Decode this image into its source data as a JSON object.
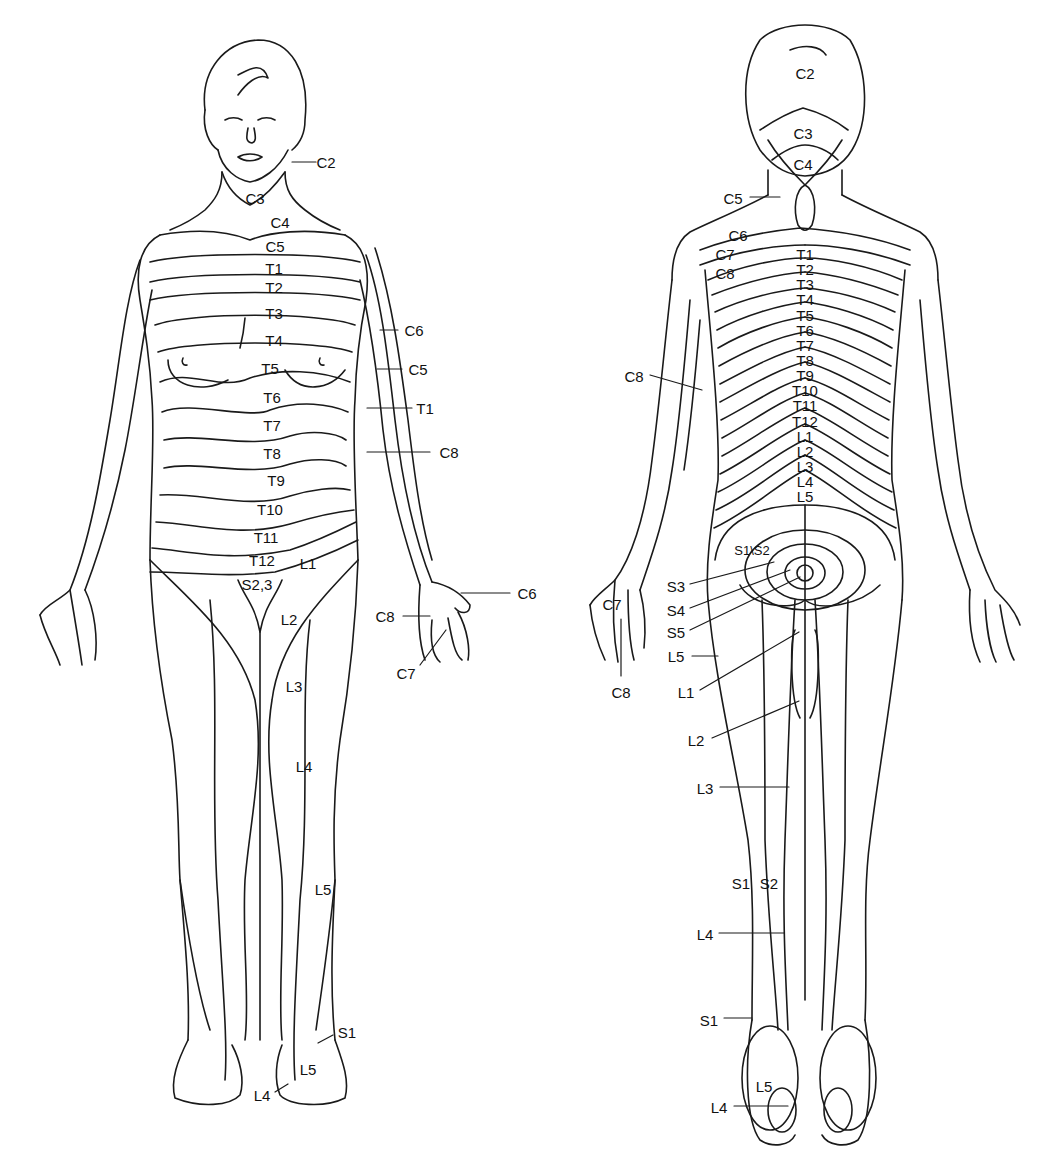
{
  "figure": {
    "type": "dermatome-map",
    "views": [
      "anterior",
      "posterior"
    ]
  },
  "anterior": {
    "labels": [
      {
        "text": "C2",
        "x": 326,
        "y": 162,
        "leader": [
          292,
          162,
          316,
          162
        ]
      },
      {
        "text": "C3",
        "x": 255,
        "y": 198
      },
      {
        "text": "C4",
        "x": 280,
        "y": 222
      },
      {
        "text": "C5",
        "x": 275,
        "y": 246
      },
      {
        "text": "T1",
        "x": 274,
        "y": 268
      },
      {
        "text": "T2",
        "x": 274,
        "y": 287
      },
      {
        "text": "T3",
        "x": 274,
        "y": 313
      },
      {
        "text": "T4",
        "x": 274,
        "y": 340
      },
      {
        "text": "T5",
        "x": 270,
        "y": 368
      },
      {
        "text": "T6",
        "x": 272,
        "y": 397
      },
      {
        "text": "T7",
        "x": 272,
        "y": 425
      },
      {
        "text": "T8",
        "x": 272,
        "y": 453
      },
      {
        "text": "T9",
        "x": 276,
        "y": 480
      },
      {
        "text": "T10",
        "x": 270,
        "y": 509
      },
      {
        "text": "T11",
        "x": 266,
        "y": 537
      },
      {
        "text": "T12",
        "x": 262,
        "y": 560
      },
      {
        "text": "L1",
        "x": 308,
        "y": 563
      },
      {
        "text": "S2,3",
        "x": 257,
        "y": 584
      },
      {
        "text": "L2",
        "x": 289,
        "y": 619
      },
      {
        "text": "L3",
        "x": 294,
        "y": 686
      },
      {
        "text": "L4",
        "x": 304,
        "y": 766
      },
      {
        "text": "L5",
        "x": 323,
        "y": 889
      },
      {
        "text": "S1",
        "x": 347,
        "y": 1032,
        "leader": [
          318,
          1043,
          333,
          1035
        ]
      },
      {
        "text": "L5",
        "x": 308,
        "y": 1069
      },
      {
        "text": "L4",
        "x": 262,
        "y": 1095,
        "leader": [
          275,
          1092,
          288,
          1084
        ]
      },
      {
        "text": "C6",
        "x": 414,
        "y": 330,
        "leader": [
          380,
          330,
          398,
          330
        ]
      },
      {
        "text": "C5",
        "x": 418,
        "y": 369,
        "leader": [
          377,
          369,
          402,
          369
        ]
      },
      {
        "text": "T1",
        "x": 425,
        "y": 408,
        "leader": [
          367,
          408,
          412,
          408
        ]
      },
      {
        "text": "C8",
        "x": 449,
        "y": 452,
        "leader": [
          367,
          452,
          430,
          452
        ]
      },
      {
        "text": "C6",
        "x": 527,
        "y": 593,
        "leader": [
          461,
          593,
          510,
          593
        ]
      },
      {
        "text": "C8",
        "x": 385,
        "y": 616,
        "leader": [
          403,
          616,
          430,
          616
        ]
      },
      {
        "text": "C7",
        "x": 406,
        "y": 673,
        "leader": [
          420,
          665,
          446,
          630
        ]
      }
    ]
  },
  "posterior": {
    "labels": [
      {
        "text": "C2",
        "x": 805,
        "y": 73
      },
      {
        "text": "C3",
        "x": 803,
        "y": 133
      },
      {
        "text": "C4",
        "x": 803,
        "y": 164
      },
      {
        "text": "C5",
        "x": 733,
        "y": 198,
        "leader": [
          750,
          197,
          780,
          197
        ]
      },
      {
        "text": "C6",
        "x": 738,
        "y": 235
      },
      {
        "text": "C7",
        "x": 725,
        "y": 254
      },
      {
        "text": "C8",
        "x": 725,
        "y": 273
      },
      {
        "text": "T1",
        "x": 805,
        "y": 254
      },
      {
        "text": "T2",
        "x": 805,
        "y": 269
      },
      {
        "text": "T3",
        "x": 805,
        "y": 284
      },
      {
        "text": "T4",
        "x": 805,
        "y": 299
      },
      {
        "text": "T5",
        "x": 805,
        "y": 315
      },
      {
        "text": "T6",
        "x": 805,
        "y": 330
      },
      {
        "text": "T7",
        "x": 805,
        "y": 345
      },
      {
        "text": "T8",
        "x": 805,
        "y": 360
      },
      {
        "text": "T9",
        "x": 805,
        "y": 375
      },
      {
        "text": "T10",
        "x": 805,
        "y": 390
      },
      {
        "text": "T11",
        "x": 805,
        "y": 405
      },
      {
        "text": "T12",
        "x": 805,
        "y": 421
      },
      {
        "text": "L1",
        "x": 805,
        "y": 436
      },
      {
        "text": "L2",
        "x": 805,
        "y": 451
      },
      {
        "text": "L3",
        "x": 805,
        "y": 466
      },
      {
        "text": "L4",
        "x": 805,
        "y": 481
      },
      {
        "text": "L5",
        "x": 805,
        "y": 496
      },
      {
        "text": "C8",
        "x": 634,
        "y": 376,
        "leader": [
          650,
          375,
          702,
          390
        ]
      },
      {
        "text": "S1\\S2",
        "x": 752,
        "y": 550,
        "small": true
      },
      {
        "text": "S3",
        "x": 676,
        "y": 586,
        "leader": [
          690,
          584,
          774,
          562
        ]
      },
      {
        "text": "S4",
        "x": 676,
        "y": 610,
        "leader": [
          690,
          608,
          790,
          570
        ]
      },
      {
        "text": "S5",
        "x": 676,
        "y": 632,
        "leader": [
          690,
          630,
          800,
          577
        ]
      },
      {
        "text": "L5",
        "x": 676,
        "y": 656,
        "leader": [
          692,
          656,
          718,
          656
        ]
      },
      {
        "text": "C7",
        "x": 612,
        "y": 604
      },
      {
        "text": "C8",
        "x": 621,
        "y": 692,
        "leader": [
          621,
          619,
          621,
          676
        ]
      },
      {
        "text": "L1",
        "x": 686,
        "y": 692,
        "leader": [
          700,
          690,
          799,
          632
        ]
      },
      {
        "text": "L2",
        "x": 696,
        "y": 740,
        "leader": [
          712,
          738,
          799,
          701
        ]
      },
      {
        "text": "L3",
        "x": 705,
        "y": 788,
        "leader": [
          720,
          787,
          789,
          787
        ]
      },
      {
        "text": "S1",
        "x": 741,
        "y": 883
      },
      {
        "text": "S2",
        "x": 769,
        "y": 883
      },
      {
        "text": "L4",
        "x": 705,
        "y": 934,
        "leader": [
          719,
          933,
          784,
          933
        ]
      },
      {
        "text": "S1",
        "x": 709,
        "y": 1020,
        "leader": [
          724,
          1018,
          752,
          1018
        ]
      },
      {
        "text": "L5",
        "x": 764,
        "y": 1086
      },
      {
        "text": "L4",
        "x": 719,
        "y": 1107,
        "leader": [
          734,
          1106,
          788,
          1106
        ]
      }
    ]
  }
}
